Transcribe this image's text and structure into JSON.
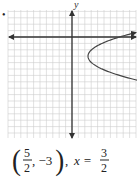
{
  "item_marker": "•",
  "chart_data": {
    "type": "line",
    "title": "",
    "xlabel": "",
    "ylabel": "y",
    "xlim": [
      -10,
      10
    ],
    "ylim": [
      -15,
      4
    ],
    "grid": true,
    "series": [
      {
        "name": "parabola",
        "equation": "x = (1/8)(y+3)^2 + 5/2",
        "vertex": [
          2.5,
          -3
        ],
        "axis_of_symmetry": "y = -3",
        "opens": "right",
        "endpoints": [
          [
            10,
            0.7
          ],
          [
            10,
            -7.5
          ]
        ]
      }
    ],
    "colors": {
      "axis": "#333333",
      "curve": "#444444",
      "grid": "#cccccc"
    }
  },
  "answer": {
    "open_paren": "(",
    "frac1_num": "5",
    "frac1_den": "2",
    "sep": ", −3",
    "close_paren": ")",
    "comma": ",",
    "x_eq": "x =",
    "frac2_num": "3",
    "frac2_den": "2"
  }
}
